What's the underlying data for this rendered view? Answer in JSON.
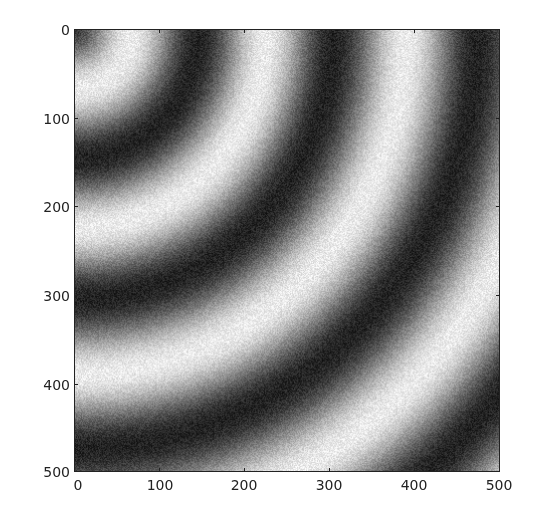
{
  "chart_data": {
    "type": "heatmap",
    "title": "",
    "xlabel": "",
    "ylabel": "",
    "colormap": "gray",
    "xlim": [
      0,
      500
    ],
    "ylim": [
      500,
      0
    ],
    "x_ticks": [
      0,
      100,
      200,
      300,
      400,
      500
    ],
    "y_ticks": [
      0,
      100,
      200,
      300,
      400,
      500
    ],
    "x_tick_labels": [
      "0",
      "100",
      "200",
      "300",
      "400",
      "500"
    ],
    "y_tick_labels": [
      "0",
      "100",
      "200",
      "300",
      "400",
      "500"
    ],
    "grid": false,
    "legend": null,
    "ring_center": [
      0,
      0
    ],
    "ring_profile": {
      "radius": [
        0,
        67,
        146,
        225,
        305,
        391,
        475,
        565,
        650,
        735
      ],
      "phase_periods": [
        -0.42,
        0,
        0.5,
        1,
        1.5,
        2,
        2.5,
        3,
        3.5,
        4
      ],
      "bright_radii": [
        67,
        225,
        391,
        565,
        735
      ],
      "dark_radii": [
        146,
        305,
        475,
        650
      ]
    },
    "gray_range": [
      35,
      235
    ],
    "noise_amplitude": 22
  },
  "axes": {
    "x_labels": [
      "0",
      "100",
      "200",
      "300",
      "400",
      "500"
    ],
    "y_labels": [
      "0",
      "100",
      "200",
      "300",
      "400",
      "500"
    ]
  }
}
